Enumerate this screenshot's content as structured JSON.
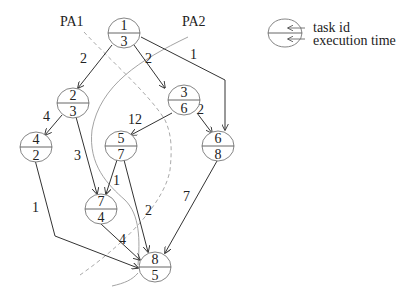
{
  "partitions": {
    "pa1_label": "PA1",
    "pa2_label": "PA2"
  },
  "legend": {
    "task_id_label": "task id",
    "execution_time_label": "execution time"
  },
  "nodes": [
    {
      "id": "1",
      "time": "3"
    },
    {
      "id": "2",
      "time": "3"
    },
    {
      "id": "3",
      "time": "6"
    },
    {
      "id": "4",
      "time": "2"
    },
    {
      "id": "5",
      "time": "7"
    },
    {
      "id": "6",
      "time": "8"
    },
    {
      "id": "7",
      "time": "4"
    },
    {
      "id": "8",
      "time": "5"
    }
  ],
  "edges": [
    {
      "from": "1",
      "to": "2",
      "weight": "2"
    },
    {
      "from": "1",
      "to": "3",
      "weight": "2"
    },
    {
      "from": "1",
      "to": "6",
      "weight": "1"
    },
    {
      "from": "2",
      "to": "4",
      "weight": "4"
    },
    {
      "from": "2",
      "to": "7",
      "weight": "3"
    },
    {
      "from": "3",
      "to": "5",
      "weight": "12"
    },
    {
      "from": "3",
      "to": "6",
      "weight": "2"
    },
    {
      "from": "5",
      "to": "7",
      "weight": "1"
    },
    {
      "from": "5",
      "to": "8",
      "weight": "2"
    },
    {
      "from": "4",
      "to": "8",
      "weight": "1"
    },
    {
      "from": "7",
      "to": "8",
      "weight": "4"
    },
    {
      "from": "6",
      "to": "8",
      "weight": "7"
    }
  ]
}
